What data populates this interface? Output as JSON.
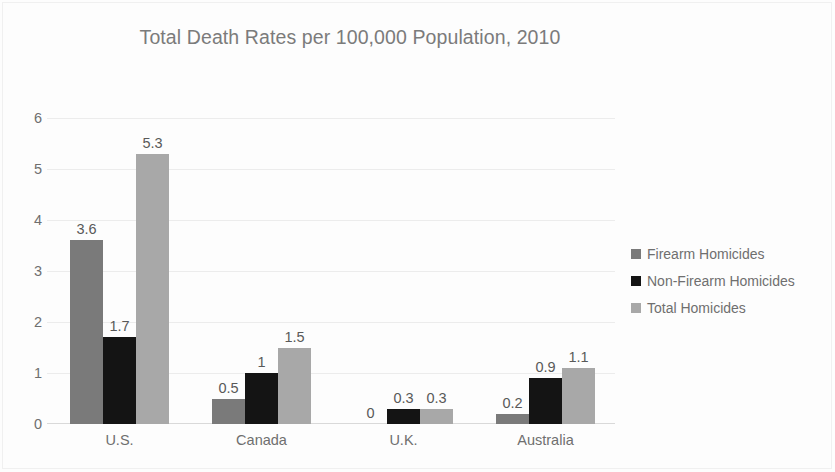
{
  "chart_data": {
    "type": "bar",
    "title": "Total Death Rates per 100,000 Population, 2010",
    "xlabel": "",
    "ylabel": "",
    "ylim": [
      0,
      6
    ],
    "yticks": [
      "0",
      "1",
      "2",
      "3",
      "4",
      "5",
      "6"
    ],
    "grid": true,
    "legend_position": "right",
    "categories": [
      "U.S.",
      "Canada",
      "U.K.",
      "Australia"
    ],
    "series": [
      {
        "name": "Firearm Homicides",
        "color": "#7a7a7a",
        "values": [
          3.6,
          0.5,
          0,
          0.2
        ],
        "labels": [
          "3.6",
          "0.5",
          "0",
          "0.2"
        ]
      },
      {
        "name": "Non-Firearm Homicides",
        "color": "#141414",
        "values": [
          1.7,
          1,
          0.3,
          0.9
        ],
        "labels": [
          "1.7",
          "1",
          "0.3",
          "0.9"
        ]
      },
      {
        "name": "Total Homicides",
        "color": "#a8a8a8",
        "values": [
          5.3,
          1.5,
          0.3,
          1.1
        ],
        "labels": [
          "5.3",
          "1.5",
          "0.3",
          "1.1"
        ]
      }
    ]
  },
  "colors": {
    "title": "#7b7b7b",
    "tick": "#6f6f6f",
    "data_label": "#595959",
    "gridline": "#ececec",
    "background": "#fdfdfd"
  }
}
